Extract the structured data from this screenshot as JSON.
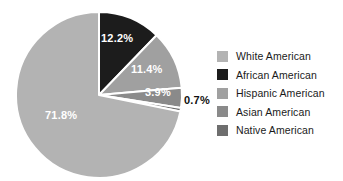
{
  "chart_data": {
    "type": "pie",
    "title": "",
    "subtitle": "",
    "xlabel": "",
    "ylabel": "",
    "grid": false,
    "legend_position": "right",
    "start_angle_deg": 0,
    "direction": "clockwise",
    "categories": [
      "White American",
      "African American",
      "Hispanic American",
      "Asian American",
      "Native American"
    ],
    "values": [
      71.8,
      12.2,
      11.4,
      3.9,
      0.7
    ],
    "value_unit": "%",
    "colors": [
      "#b3b3b3",
      "#1c1c1c",
      "#a0a0a0",
      "#8a8a8a",
      "#6e6e6e"
    ],
    "slices": [
      {
        "name": "African American",
        "value": 12.2,
        "label": "12.2%",
        "color": "#1c1c1c",
        "label_color": "#ffffff",
        "label_placement": "inside",
        "start_deg": 0,
        "end_deg": 43.92
      },
      {
        "name": "Hispanic American",
        "value": 11.4,
        "label": "11.4%",
        "color": "#a0a0a0",
        "label_color": "#ffffff",
        "label_placement": "inside",
        "start_deg": 43.92,
        "end_deg": 84.96
      },
      {
        "name": "Asian American",
        "value": 3.9,
        "label": "3.9%",
        "color": "#8a8a8a",
        "label_color": "#ffffff",
        "label_placement": "inside",
        "start_deg": 84.96,
        "end_deg": 99.0
      },
      {
        "name": "Native American",
        "value": 0.7,
        "label": "0.7%",
        "color": "#6e6e6e",
        "label_color": "#101010",
        "label_placement": "outside",
        "start_deg": 99.0,
        "end_deg": 101.52
      },
      {
        "name": "White American",
        "value": 71.8,
        "label": "71.8%",
        "color": "#b3b3b3",
        "label_color": "#ffffff",
        "label_placement": "inside",
        "start_deg": 101.52,
        "end_deg": 360.0
      }
    ],
    "separator_color": "#ffffff"
  },
  "legend": {
    "items": [
      {
        "label": "White American",
        "color": "#b3b3b3"
      },
      {
        "label": "African American",
        "color": "#1c1c1c"
      },
      {
        "label": "Hispanic American",
        "color": "#a0a0a0"
      },
      {
        "label": "Asian American",
        "color": "#8a8a8a"
      },
      {
        "label": "Native American",
        "color": "#6e6e6e"
      }
    ]
  },
  "labels": {
    "african_american": "12.2%",
    "hispanic_american": "11.4%",
    "asian_american": "3.9%",
    "native_american": "0.7%",
    "white_american": "71.8%"
  }
}
